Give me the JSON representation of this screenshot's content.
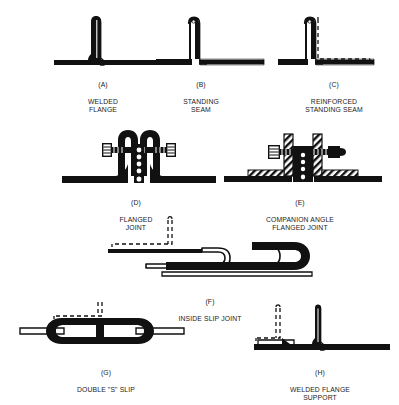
{
  "diagram": {
    "background_color": "#ffffff",
    "ink_color": "#111111",
    "figures": [
      {
        "key": "A",
        "tag": "(A)",
        "caption": "WELDED\nFLANGE",
        "label_x": 68,
        "label_y": 72,
        "label_w": 70,
        "fig_x": 52,
        "fig_y": 14,
        "fig_w": 118,
        "fig_h": 56
      },
      {
        "key": "B",
        "tag": "(B)",
        "caption": "STANDING\nSEAM",
        "label_x": 166,
        "label_y": 72,
        "label_w": 70,
        "fig_x": 156,
        "fig_y": 14,
        "fig_w": 110,
        "fig_h": 56
      },
      {
        "key": "C",
        "tag": "(C)",
        "caption": "REINFORCED\nSTANDING SEAM",
        "label_x": 286,
        "label_y": 72,
        "label_w": 96,
        "fig_x": 278,
        "fig_y": 14,
        "fig_w": 114,
        "fig_h": 56
      },
      {
        "key": "D",
        "tag": "(D)",
        "caption": "FLANGED\nJOINT",
        "label_x": 100,
        "label_y": 190,
        "label_w": 72,
        "fig_x": 60,
        "fig_y": 124,
        "fig_w": 158,
        "fig_h": 62
      },
      {
        "key": "E",
        "tag": "(E)",
        "caption": "COMPANION ANGLE\nFLANGED JOINT",
        "label_x": 236,
        "label_y": 190,
        "label_w": 128,
        "fig_x": 222,
        "fig_y": 124,
        "fig_w": 162,
        "fig_h": 62
      },
      {
        "key": "F",
        "tag": "(F)",
        "caption": "INSIDE SLIP JOINT",
        "label_x": 152,
        "label_y": 289,
        "label_w": 116,
        "fig_x": 106,
        "fig_y": 216,
        "fig_w": 216,
        "fig_h": 70
      },
      {
        "key": "G",
        "tag": "(G)",
        "caption": "DOUBLE \"S\" SLIP",
        "label_x": 44,
        "label_y": 360,
        "label_w": 124,
        "fig_x": 18,
        "fig_y": 300,
        "fig_w": 172,
        "fig_h": 56
      },
      {
        "key": "H",
        "tag": "(H)",
        "caption": "WELDED FLANGE\nSUPPORT",
        "label_x": 258,
        "label_y": 360,
        "label_w": 124,
        "fig_x": 252,
        "fig_y": 304,
        "fig_w": 140,
        "fig_h": 52
      }
    ]
  }
}
